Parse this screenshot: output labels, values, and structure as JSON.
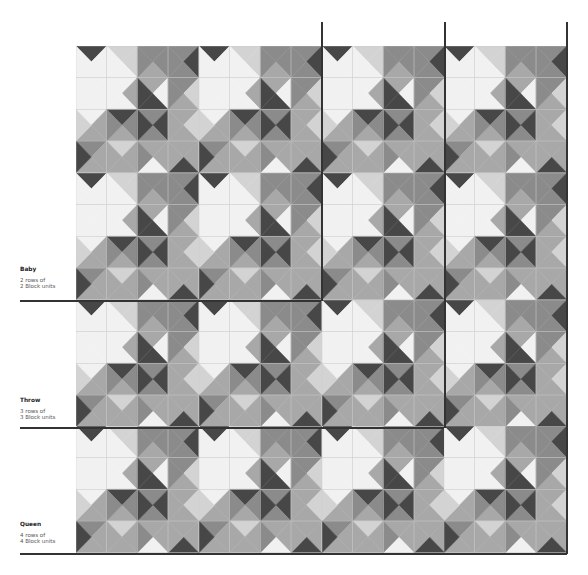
{
  "palette": {
    "W": "#f1f1f1",
    "L": "#d3d3d3",
    "M": "#a8a8a8",
    "G": "#8b8b8b",
    "D": "#474747",
    "seam": "#c8c8c8"
  },
  "quilt": {
    "rows": 4,
    "cols": 4,
    "block_grid": 4,
    "block_cells": [
      [
        [
          "D",
          "W",
          "W",
          "W"
        ],
        [
          "L",
          "L",
          "W",
          "W"
        ],
        [
          "G",
          "G",
          "M",
          "G"
        ],
        [
          "G",
          "D",
          "G",
          "G"
        ]
      ],
      [
        [
          "W",
          "W",
          "W",
          "W"
        ],
        [
          "W",
          "M",
          "W",
          "W"
        ],
        [
          "M",
          "W",
          "D",
          "D"
        ],
        [
          "G",
          "L",
          "M",
          "G"
        ]
      ],
      [
        [
          "W",
          "M",
          "M",
          "L"
        ],
        [
          "D",
          "G",
          "M",
          "G"
        ],
        [
          "G",
          "D",
          "G",
          "D"
        ],
        [
          "M",
          "L",
          "M",
          "M"
        ]
      ],
      [
        [
          "G",
          "M",
          "M",
          "D"
        ],
        [
          "L",
          "M",
          "M",
          "M"
        ],
        [
          "M",
          "M",
          "W",
          "G"
        ],
        [
          "M",
          "M",
          "D",
          "M"
        ]
      ]
    ]
  },
  "sizes": [
    {
      "name": "Baby",
      "desc_line1": "2 rows of",
      "desc_line2": "2 Block units",
      "rows": 2,
      "cols": 2
    },
    {
      "name": "Throw",
      "desc_line1": "3 rows of",
      "desc_line2": "3 Block units",
      "rows": 3,
      "cols": 3
    },
    {
      "name": "Queen",
      "desc_line1": "4 rows of",
      "desc_line2": "4 Block units",
      "rows": 4,
      "cols": 4
    }
  ]
}
